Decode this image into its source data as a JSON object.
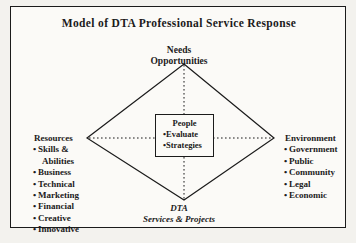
{
  "diagram": {
    "title": "Model of DTA Professional Service Response",
    "top_label": {
      "line1": "Needs",
      "line2": "Opportunities"
    },
    "bottom_label": {
      "line1": "DTA",
      "line2": "Services & Projects"
    },
    "center_box": {
      "heading": "People",
      "items": [
        "Evaluate",
        "Strategies"
      ]
    },
    "left_group": {
      "heading": "Resources",
      "items": [
        "Skills &",
        "Business",
        "Technical",
        "Marketing",
        "Financial",
        "Creative",
        "Innovative"
      ],
      "continuation": "Abilities"
    },
    "right_group": {
      "heading": "Environment",
      "items": [
        "Government",
        "Public",
        "Community",
        "Legal",
        "Economic"
      ]
    },
    "bullet": "•",
    "colors": {
      "ink": "#1b1b1b",
      "page": "#fbfaf7",
      "outside": "#f3f2ee"
    }
  }
}
